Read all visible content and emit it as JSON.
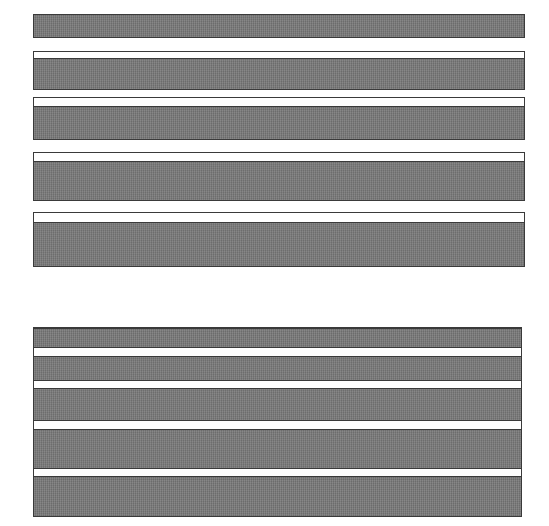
{
  "page": {
    "kind": "scanned-document-page",
    "background_color": "#ffffff",
    "width": 549,
    "height": 526,
    "redaction_fill_color": "#757575",
    "redaction_border_color": "#3a3a3a",
    "content_state": "fully-redacted",
    "visible_text": ""
  },
  "upper_section": {
    "name": "redacted-paragraph-block-group",
    "count": 5,
    "blocks": [
      {
        "label": "",
        "x": 33,
        "y": 14,
        "width": 492,
        "height": 24,
        "lead_gap": 0,
        "fill_height": 24
      },
      {
        "label": "",
        "x": 33,
        "y": 51,
        "width": 492,
        "height": 39,
        "lead_gap": 9,
        "fill_height": 30
      },
      {
        "label": "",
        "x": 33,
        "y": 97,
        "width": 492,
        "height": 43,
        "lead_gap": 11,
        "fill_height": 32
      },
      {
        "label": "",
        "x": 33,
        "y": 152,
        "width": 492,
        "height": 49,
        "lead_gap": 11,
        "fill_height": 38
      },
      {
        "label": "",
        "x": 33,
        "y": 212,
        "width": 492,
        "height": 55,
        "lead_gap": 12,
        "fill_height": 43
      }
    ]
  },
  "lower_section": {
    "name": "redacted-table-block",
    "x": 33,
    "y": 327,
    "width": 489,
    "height": 190,
    "band_count": 5,
    "bands": [
      {
        "label": "",
        "top": 0,
        "height": 20
      },
      {
        "label": "",
        "top": 28,
        "height": 25
      },
      {
        "label": "",
        "top": 60,
        "height": 33
      },
      {
        "label": "",
        "top": 101,
        "height": 40
      },
      {
        "label": "",
        "top": 148,
        "height": 42
      }
    ]
  }
}
